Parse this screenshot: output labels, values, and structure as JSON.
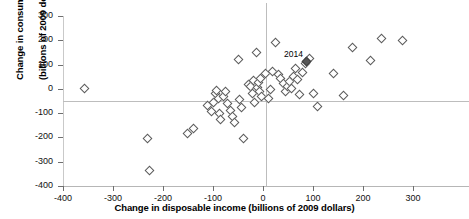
{
  "chart_data": {
    "type": "scatter",
    "title": "",
    "xlabel": "Change in disposable income (billions of 2009 dollars)",
    "ylabel_line1": "Change in consumption",
    "ylabel_line2": "(billions of 2009 dollars)",
    "xlim": [
      -400,
      300
    ],
    "ylim": [
      -400,
      300
    ],
    "xticks": [
      -400,
      -300,
      -200,
      -100,
      0,
      100,
      200,
      300
    ],
    "xticklabels": [
      "-400",
      "-300",
      "-200",
      "-100",
      "0",
      "100",
      "200",
      "300"
    ],
    "yticks": [
      -400,
      -300,
      -200,
      -100,
      0,
      100,
      200,
      300
    ],
    "yticklabels": [
      "-400",
      "-300",
      "-200",
      "-100",
      "0",
      "100",
      "200",
      "300"
    ],
    "grid": false,
    "zero_lines": true,
    "legend": "none",
    "marker": "diamond",
    "marker_color": "#ffffff",
    "marker_edge_color": "#5a5a5a",
    "highlight_marker_color": "#555555",
    "annotations": [
      {
        "text": "2014",
        "x": 86,
        "y": 140
      }
    ],
    "points": [
      {
        "x": -357,
        "y": 0
      },
      {
        "x": -232,
        "y": -205
      },
      {
        "x": -228,
        "y": -338
      },
      {
        "x": -152,
        "y": -185
      },
      {
        "x": -140,
        "y": -163
      },
      {
        "x": -112,
        "y": -70
      },
      {
        "x": -104,
        "y": -95
      },
      {
        "x": -100,
        "y": -55
      },
      {
        "x": -96,
        "y": -20
      },
      {
        "x": -93,
        "y": -8
      },
      {
        "x": -90,
        "y": -40
      },
      {
        "x": -88,
        "y": -100
      },
      {
        "x": -86,
        "y": -125
      },
      {
        "x": -80,
        "y": -30
      },
      {
        "x": -76,
        "y": -12
      },
      {
        "x": -72,
        "y": -60
      },
      {
        "x": -66,
        "y": -90
      },
      {
        "x": -62,
        "y": -115
      },
      {
        "x": -58,
        "y": -140
      },
      {
        "x": -50,
        "y": 120
      },
      {
        "x": -48,
        "y": -45
      },
      {
        "x": -44,
        "y": -75
      },
      {
        "x": -40,
        "y": -205
      },
      {
        "x": -30,
        "y": 20
      },
      {
        "x": -26,
        "y": 10
      },
      {
        "x": -22,
        "y": -18
      },
      {
        "x": -20,
        "y": 35
      },
      {
        "x": -18,
        "y": -55
      },
      {
        "x": -14,
        "y": 148
      },
      {
        "x": -12,
        "y": 5
      },
      {
        "x": -10,
        "y": 28
      },
      {
        "x": -8,
        "y": -10
      },
      {
        "x": -6,
        "y": 42
      },
      {
        "x": -4,
        "y": -32
      },
      {
        "x": 4,
        "y": 65
      },
      {
        "x": 10,
        "y": -40
      },
      {
        "x": 14,
        "y": -2
      },
      {
        "x": 18,
        "y": 70
      },
      {
        "x": 24,
        "y": 190
      },
      {
        "x": 30,
        "y": 60
      },
      {
        "x": 34,
        "y": 42
      },
      {
        "x": 40,
        "y": 22
      },
      {
        "x": 44,
        "y": -12
      },
      {
        "x": 48,
        "y": 10
      },
      {
        "x": 52,
        "y": 30
      },
      {
        "x": 56,
        "y": 0
      },
      {
        "x": 60,
        "y": 52
      },
      {
        "x": 64,
        "y": 85
      },
      {
        "x": 68,
        "y": 38
      },
      {
        "x": 72,
        "y": -22
      },
      {
        "x": 78,
        "y": 68
      },
      {
        "x": 84,
        "y": 105
      },
      {
        "x": 92,
        "y": 125
      },
      {
        "x": 100,
        "y": -18
      },
      {
        "x": 108,
        "y": -72
      },
      {
        "x": 140,
        "y": 62
      },
      {
        "x": 160,
        "y": -28
      },
      {
        "x": 178,
        "y": 170
      },
      {
        "x": 214,
        "y": 118
      },
      {
        "x": 236,
        "y": 208
      },
      {
        "x": 278,
        "y": 200
      }
    ],
    "highlight_point": {
      "x": 86,
      "y": 112,
      "label": "2014"
    }
  }
}
